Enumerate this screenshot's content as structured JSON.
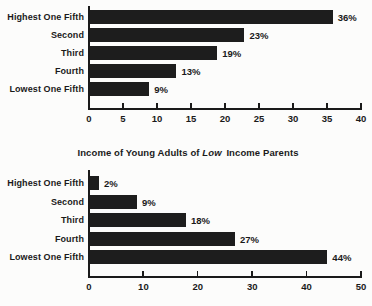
{
  "figure": {
    "background": "#fcfcfb",
    "bar_color": "#1d1d1d",
    "axis_color": "#1a1a1a",
    "text_color": "#1a1a1a"
  },
  "chart_data": [
    {
      "type": "bar",
      "orientation": "horizontal",
      "title": "",
      "title_parts": [],
      "categories": [
        "Highest One Fifth",
        "Second",
        "Third",
        "Fourth",
        "Lowest One Fifth"
      ],
      "values": [
        36,
        23,
        19,
        13,
        9
      ],
      "value_labels": [
        "36%",
        "23%",
        "19%",
        "13%",
        "9%"
      ],
      "xlabel": "",
      "ylabel": "",
      "xlim": [
        0,
        40
      ],
      "xticks": [
        0,
        5,
        10,
        15,
        20,
        25,
        30,
        35,
        40
      ],
      "grid": false,
      "legend": "none"
    },
    {
      "type": "bar",
      "orientation": "horizontal",
      "title": "Income of Young Adults of Low Income Parents",
      "title_parts": [
        {
          "text": "Income of Young Adults of ",
          "italic": false
        },
        {
          "text": "Low",
          "italic": true
        },
        {
          "text": " Income Parents",
          "italic": false
        }
      ],
      "categories": [
        "Highest One Fifth",
        "Second",
        "Third",
        "Fourth",
        "Lowest One Fifth"
      ],
      "values": [
        2,
        9,
        18,
        27,
        44
      ],
      "value_labels": [
        "2%",
        "9%",
        "18%",
        "27%",
        "44%"
      ],
      "xlabel": "",
      "ylabel": "",
      "xlim": [
        0,
        50
      ],
      "xticks": [
        0,
        10,
        20,
        30,
        40,
        50
      ],
      "grid": false,
      "legend": "none"
    }
  ]
}
